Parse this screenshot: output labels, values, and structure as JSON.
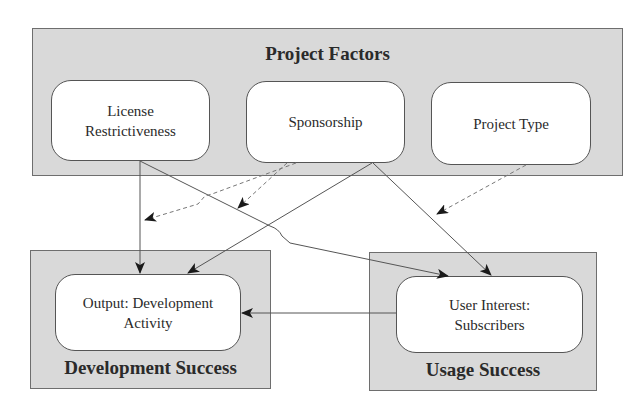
{
  "diagram": {
    "groups": {
      "project_factors": {
        "title": "Project Factors"
      },
      "development_success": {
        "title": "Development Success"
      },
      "usage_success": {
        "title": "Usage Success"
      }
    },
    "nodes": {
      "license": {
        "label": "License Restrictiveness",
        "line1": "License",
        "line2": "Restrictiveness"
      },
      "sponsorship": {
        "label": "Sponsorship"
      },
      "project_type": {
        "label": "Project Type"
      },
      "output": {
        "label": "Output: Development Activity",
        "line1": "Output: Development",
        "line2": "Activity"
      },
      "user_interest": {
        "label": "User Interest: Subscribers",
        "line1": "User Interest:",
        "line2": "Subscribers"
      }
    },
    "edges": [
      {
        "from": "License Restrictiveness",
        "to": "Output: Development Activity",
        "style": "solid"
      },
      {
        "from": "License Restrictiveness",
        "to": "User Interest: Subscribers",
        "style": "solid"
      },
      {
        "from": "Sponsorship",
        "to": "Output: Development Activity",
        "style": "solid"
      },
      {
        "from": "Sponsorship",
        "to": "User Interest: Subscribers",
        "style": "solid"
      },
      {
        "from": "User Interest: Subscribers",
        "to": "Output: Development Activity",
        "style": "solid"
      },
      {
        "from": "Sponsorship",
        "to": "License Restrictiveness -> Output: Development Activity",
        "style": "dashed",
        "note": "moderating effect"
      },
      {
        "from": "Sponsorship",
        "to": "License Restrictiveness -> User Interest: Subscribers",
        "style": "dashed",
        "note": "moderating effect"
      },
      {
        "from": "Project Type",
        "to": "Sponsorship -> User Interest: Subscribers",
        "style": "dashed",
        "note": "moderating effect"
      }
    ],
    "colors": {
      "group_fill": "#d9d9d9",
      "node_fill": "#ffffff",
      "line": "#555555",
      "dashed_line": "#777777",
      "arrowhead": "#1a1a1a"
    }
  }
}
